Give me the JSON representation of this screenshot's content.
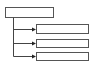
{
  "diagram": {
    "type": "tree",
    "colors": {
      "box_border": "#555555",
      "box_fill": "#ffffff",
      "connector": "#444444",
      "arrowhead": "#222222",
      "background": "#ffffff"
    },
    "root": {
      "label": ""
    },
    "children": [
      {
        "label": ""
      },
      {
        "label": ""
      },
      {
        "label": ""
      }
    ]
  }
}
